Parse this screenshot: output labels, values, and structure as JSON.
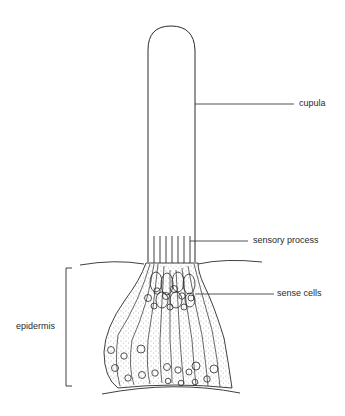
{
  "diagram": {
    "labels": {
      "cupula": "cupula",
      "sensory_process": "sensory process",
      "sense_cells": "sense cells",
      "epidermis": "epidermis"
    },
    "colors": {
      "ink": "#2a2a2a",
      "stipple": "#6a6a6a",
      "background": "#ffffff"
    }
  }
}
